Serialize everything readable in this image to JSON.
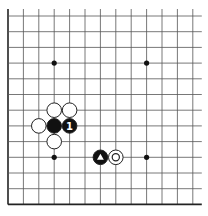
{
  "diagram": {
    "type": "go-board-fragment",
    "grid": {
      "columns": 13,
      "rows": 13,
      "x0": 8,
      "y0": 16,
      "dx": 15.4,
      "dy": 15.7,
      "top_edge_open": true,
      "right_edge_open": true,
      "left_edge": true,
      "bottom_edge": true,
      "line_color": "#555555",
      "edge_color": "#222222"
    },
    "hoshi": [
      {
        "col": 3,
        "row": 3
      },
      {
        "col": 9,
        "row": 3
      },
      {
        "col": 3,
        "row": 9
      },
      {
        "col": 9,
        "row": 9
      }
    ],
    "stones": [
      {
        "color": "white",
        "col": 3,
        "row": 6,
        "mark": ""
      },
      {
        "color": "white",
        "col": 4,
        "row": 6,
        "mark": ""
      },
      {
        "color": "white",
        "col": 2,
        "row": 7,
        "mark": ""
      },
      {
        "color": "black",
        "col": 3,
        "row": 7,
        "mark": ""
      },
      {
        "color": "black",
        "col": 4,
        "row": 7,
        "mark": "1"
      },
      {
        "color": "white",
        "col": 3,
        "row": 8,
        "mark": ""
      },
      {
        "color": "black",
        "col": 6,
        "row": 9,
        "mark": "triangle"
      },
      {
        "color": "white",
        "col": 7,
        "row": 9,
        "mark": "circle"
      }
    ],
    "colors": {
      "black_stone": "#111111",
      "white_stone": "#ffffff",
      "stone_outline": "#222222"
    }
  }
}
